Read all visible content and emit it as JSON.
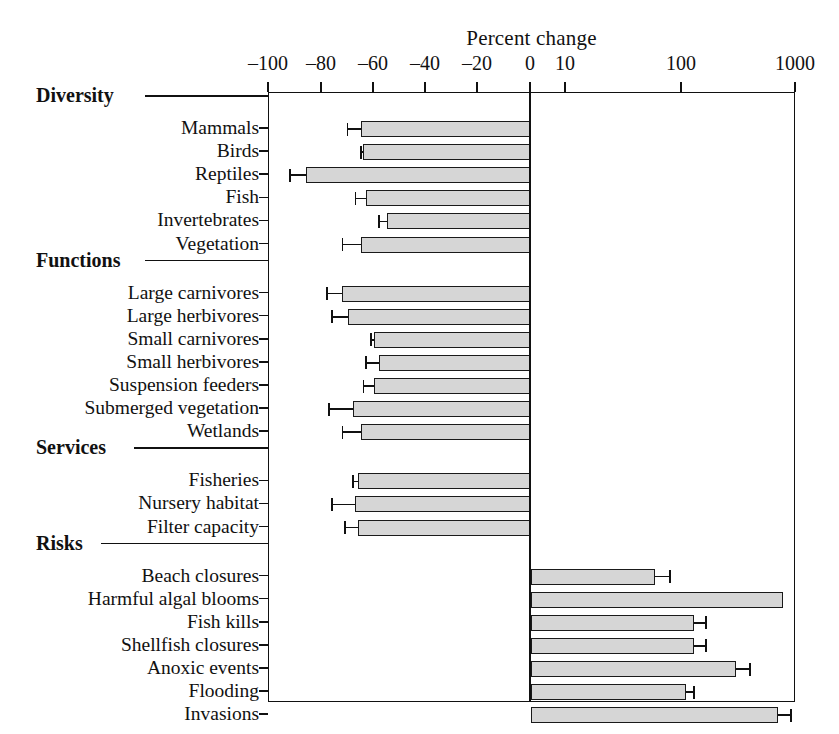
{
  "chart_data": {
    "type": "bar",
    "orientation": "horizontal",
    "title": "Percent change",
    "xlabel": "Percent change",
    "ylabel": "",
    "axis_note": "Linear from -100 to 0, logarithmic from 10 to 1000",
    "x_ticks": [
      {
        "label": "–100",
        "value": -100,
        "px": 268
      },
      {
        "label": "–80",
        "value": -80,
        "px": 321
      },
      {
        "label": "–60",
        "value": -60,
        "px": 373
      },
      {
        "label": "–40",
        "value": -40,
        "px": 425
      },
      {
        "label": "–20",
        "value": -20,
        "px": 477
      },
      {
        "label": "0",
        "value": 0,
        "px": 530
      },
      {
        "label": "10",
        "value": 10,
        "px": 565
      },
      {
        "label": "100",
        "value": 100,
        "px": 681
      },
      {
        "label": "1000",
        "value": 1000,
        "px": 795
      }
    ],
    "xlim": [
      -100,
      1000
    ],
    "grid": false,
    "legend": null,
    "bar_fill_color": "#d6d6d6",
    "bar_edge_color": "#1a1a1a",
    "groups": [
      {
        "name": "Diversity",
        "items": [
          {
            "label": "Mammals",
            "value": -65,
            "err_low": -70,
            "err_high": -65
          },
          {
            "label": "Birds",
            "value": -64,
            "err_low": -65,
            "err_high": -64
          },
          {
            "label": "Reptiles",
            "value": -86,
            "err_low": -92,
            "err_high": -86
          },
          {
            "label": "Fish",
            "value": -63,
            "err_low": -67,
            "err_high": -63
          },
          {
            "label": "Invertebrates",
            "value": -55,
            "err_low": -58,
            "err_high": -55
          },
          {
            "label": "Vegetation",
            "value": -65,
            "err_low": -72,
            "err_high": -65
          }
        ]
      },
      {
        "name": "Functions",
        "items": [
          {
            "label": "Large carnivores",
            "value": -72,
            "err_low": -78,
            "err_high": -72
          },
          {
            "label": "Large herbivores",
            "value": -70,
            "err_low": -76,
            "err_high": -70
          },
          {
            "label": "Small carnivores",
            "value": -60,
            "err_low": -61,
            "err_high": -60
          },
          {
            "label": "Small herbivores",
            "value": -58,
            "err_low": -63,
            "err_high": -58
          },
          {
            "label": "Suspension feeders",
            "value": -60,
            "err_low": -64,
            "err_high": -60
          },
          {
            "label": "Submerged vegetation",
            "value": -68,
            "err_low": -77,
            "err_high": -68
          },
          {
            "label": "Wetlands",
            "value": -65,
            "err_low": -72,
            "err_high": -65
          }
        ]
      },
      {
        "name": "Services",
        "items": [
          {
            "label": "Fisheries",
            "value": -66,
            "err_low": -68,
            "err_high": -66
          },
          {
            "label": "Nursery habitat",
            "value": -67,
            "err_low": -76,
            "err_high": -67
          },
          {
            "label": "Filter capacity",
            "value": -66,
            "err_low": -71,
            "err_high": -66
          }
        ]
      },
      {
        "name": "Risks",
        "items": [
          {
            "label": "Beach closures",
            "value": 60,
            "err_low": 60,
            "err_high": 80
          },
          {
            "label": "Harmful algal blooms",
            "value": 770,
            "err_low": 770,
            "err_high": 770
          },
          {
            "label": "Fish kills",
            "value": 130,
            "err_low": 130,
            "err_high": 165
          },
          {
            "label": "Shellfish closures",
            "value": 130,
            "err_low": 130,
            "err_high": 165
          },
          {
            "label": "Anoxic events",
            "value": 300,
            "err_low": 300,
            "err_high": 400
          },
          {
            "label": "Flooding",
            "value": 110,
            "err_low": 110,
            "err_high": 130
          },
          {
            "label": "Invasions",
            "value": 700,
            "err_low": 700,
            "err_high": 900
          }
        ]
      }
    ]
  }
}
